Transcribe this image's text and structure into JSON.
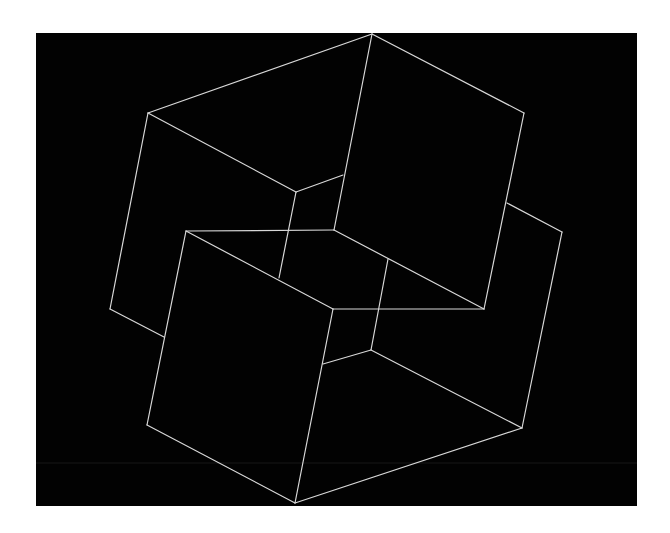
{
  "artwork": {
    "background_color": "#ffffff",
    "panel_color": "#020202",
    "line_color": "#d8d8d8",
    "scanline_color": "#161616",
    "panel": {
      "x": 36,
      "y": 33,
      "width": 601,
      "height": 473
    },
    "scanline_y": 463,
    "lines": [
      {
        "name": "top-cube-top-left-edge",
        "x1": 148,
        "y1": 113,
        "x2": 372,
        "y2": 34
      },
      {
        "name": "top-cube-top-right-edge",
        "x1": 372,
        "y1": 34,
        "x2": 524,
        "y2": 113
      },
      {
        "name": "top-cube-right-edge",
        "x1": 524,
        "y1": 113,
        "x2": 484,
        "y2": 309
      },
      {
        "name": "top-cube-center-vertical",
        "x1": 372,
        "y1": 34,
        "x2": 334,
        "y2": 230
      },
      {
        "name": "left-cube-diagonal",
        "x1": 148,
        "y1": 113,
        "x2": 296,
        "y2": 192
      },
      {
        "name": "left-cube-left-edge",
        "x1": 148,
        "y1": 113,
        "x2": 110,
        "y2": 309
      },
      {
        "name": "left-cube-bottom-edge",
        "x1": 110,
        "y1": 309,
        "x2": 164,
        "y2": 337
      },
      {
        "name": "inner-short-edge",
        "x1": 296,
        "y1": 192,
        "x2": 343,
        "y2": 175
      },
      {
        "name": "inner-vertical-left",
        "x1": 296,
        "y1": 192,
        "x2": 279,
        "y2": 278
      },
      {
        "name": "front-cube-top-edge",
        "x1": 186,
        "y1": 231,
        "x2": 334,
        "y2": 230
      },
      {
        "name": "front-cube-diagonal",
        "x1": 186,
        "y1": 231,
        "x2": 333,
        "y2": 309
      },
      {
        "name": "front-cube-left-edge",
        "x1": 186,
        "y1": 231,
        "x2": 147,
        "y2": 425
      },
      {
        "name": "front-cube-bottom-left",
        "x1": 147,
        "y1": 425,
        "x2": 295,
        "y2": 503
      },
      {
        "name": "front-cube-center-edge",
        "x1": 333,
        "y1": 309,
        "x2": 295,
        "y2": 503
      },
      {
        "name": "middle-horizontal",
        "x1": 333,
        "y1": 309,
        "x2": 484,
        "y2": 309
      },
      {
        "name": "middle-diagonal-right",
        "x1": 334,
        "y1": 230,
        "x2": 484,
        "y2": 309
      },
      {
        "name": "inner-vertical-right",
        "x1": 388,
        "y1": 259,
        "x2": 371,
        "y2": 350
      },
      {
        "name": "inner-lower-short-edge",
        "x1": 371,
        "y1": 350,
        "x2": 323,
        "y2": 364
      },
      {
        "name": "lower-cube-diagonal",
        "x1": 371,
        "y1": 350,
        "x2": 522,
        "y2": 428
      },
      {
        "name": "lower-cube-bottom-right",
        "x1": 295,
        "y1": 503,
        "x2": 522,
        "y2": 428
      },
      {
        "name": "right-cube-top-edge",
        "x1": 507,
        "y1": 203,
        "x2": 562,
        "y2": 232
      },
      {
        "name": "right-cube-right-edge",
        "x1": 562,
        "y1": 232,
        "x2": 522,
        "y2": 428
      }
    ]
  }
}
